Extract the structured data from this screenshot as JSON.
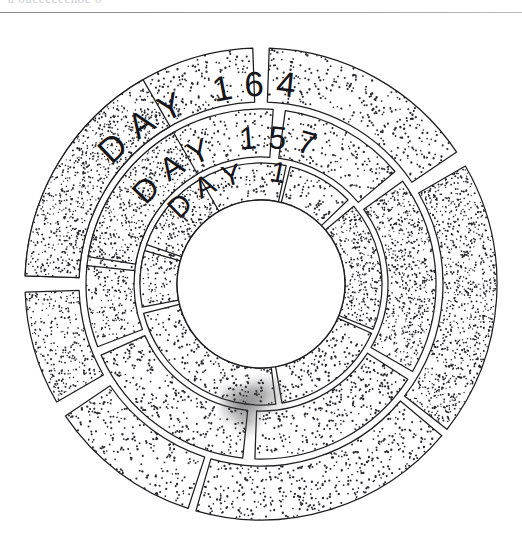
{
  "page": {
    "background_color": "#ffffff",
    "ink_color": "#1d1d1f",
    "clipped_header_text": "a oueeeeeenoe o",
    "divider_color": "#8d8f94"
  },
  "figure": {
    "name": "concentric-day-rings",
    "style": "hand-drawn stipple / pen-and-ink",
    "center_x": 261,
    "center_y": 284,
    "hub_radius": 84,
    "hub_color": "#ffffff"
  },
  "chart_data": {
    "type": "pie",
    "title": "",
    "subtitle": "",
    "xlabel": "",
    "ylabel": "",
    "legend_position": "none",
    "grid": false,
    "rings": [
      {
        "name": "outer-ring",
        "label": "DAY 164",
        "inner_radius": 182,
        "outer_radius": 236,
        "label_radius": 209,
        "segments": [
          {
            "id": "o1",
            "start_deg": -88,
            "end_deg": -2,
            "density": 0.3,
            "tone": "light"
          },
          {
            "id": "o2",
            "start_deg": 2,
            "end_deg": 56,
            "density": 0.3,
            "tone": "light"
          },
          {
            "id": "o3",
            "start_deg": 60,
            "end_deg": 128,
            "density": 0.78,
            "tone": "dark"
          },
          {
            "id": "o4",
            "start_deg": 130,
            "end_deg": 196,
            "density": 0.38,
            "tone": "light"
          },
          {
            "id": "o5",
            "start_deg": 198,
            "end_deg": 236,
            "density": 0.34,
            "tone": "light"
          },
          {
            "id": "o6",
            "start_deg": 240,
            "end_deg": 268,
            "density": 0.6,
            "tone": "mid"
          },
          {
            "id": "o7",
            "start_deg": 272,
            "end_deg": 330,
            "density": 0.72,
            "tone": "dark"
          }
        ]
      },
      {
        "name": "middle-ring",
        "label": "DAY 157",
        "inner_radius": 127,
        "outer_radius": 175,
        "label_radius": 151,
        "segments": [
          {
            "id": "m1",
            "start_deg": -86,
            "end_deg": 4,
            "density": 0.32,
            "tone": "light"
          },
          {
            "id": "m2",
            "start_deg": 8,
            "end_deg": 50,
            "density": 0.34,
            "tone": "light"
          },
          {
            "id": "m3",
            "start_deg": 54,
            "end_deg": 120,
            "density": 0.82,
            "tone": "dark"
          },
          {
            "id": "m4",
            "start_deg": 123,
            "end_deg": 182,
            "density": 0.4,
            "tone": "light"
          },
          {
            "id": "m5",
            "start_deg": 186,
            "end_deg": 246,
            "density": 0.36,
            "tone": "light"
          },
          {
            "id": "m6",
            "start_deg": 249,
            "end_deg": 276,
            "density": 0.58,
            "tone": "mid"
          },
          {
            "id": "m7",
            "start_deg": 279,
            "end_deg": 330,
            "density": 0.74,
            "tone": "dark"
          }
        ]
      },
      {
        "name": "inner-ring",
        "label": "DAY 1",
        "inner_radius": 84,
        "outer_radius": 121,
        "label_radius": 103,
        "segments": [
          {
            "id": "i1",
            "start_deg": -90,
            "end_deg": 12,
            "density": 0.34,
            "tone": "light"
          },
          {
            "id": "i2",
            "start_deg": 14,
            "end_deg": 46,
            "density": 0.36,
            "tone": "light"
          },
          {
            "id": "i3",
            "start_deg": 50,
            "end_deg": 112,
            "density": 0.86,
            "tone": "dark"
          },
          {
            "id": "i4",
            "start_deg": 114,
            "end_deg": 170,
            "density": 0.42,
            "tone": "light"
          },
          {
            "id": "i5",
            "start_deg": 173,
            "end_deg": 256,
            "density": 0.38,
            "tone": "light"
          },
          {
            "id": "i6",
            "start_deg": 259,
            "end_deg": 286,
            "density": 0.56,
            "tone": "mid"
          },
          {
            "id": "i7",
            "start_deg": 289,
            "end_deg": 330,
            "density": 0.76,
            "tone": "dark"
          }
        ]
      }
    ]
  },
  "labels": {
    "outer": "DAY 164",
    "middle": "DAY 157",
    "inner": "DAY 1"
  }
}
